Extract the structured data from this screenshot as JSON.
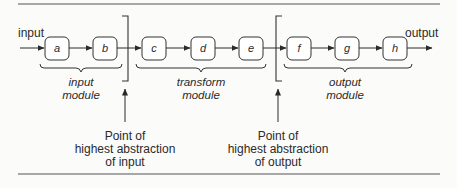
{
  "diagram": {
    "input_label": "input",
    "output_label": "output",
    "nodes": [
      "a",
      "b",
      "c",
      "d",
      "e",
      "f",
      "g",
      "h"
    ],
    "modules": [
      {
        "line1": "input",
        "line2": "module"
      },
      {
        "line1": "transform",
        "line2": "module"
      },
      {
        "line1": "output",
        "line2": "module"
      }
    ],
    "annotations": [
      {
        "line1": "Point of",
        "line2": "highest abstraction",
        "line3": "of input"
      },
      {
        "line1": "Point of",
        "line2": "highest abstraction",
        "line3": "of output"
      }
    ]
  }
}
